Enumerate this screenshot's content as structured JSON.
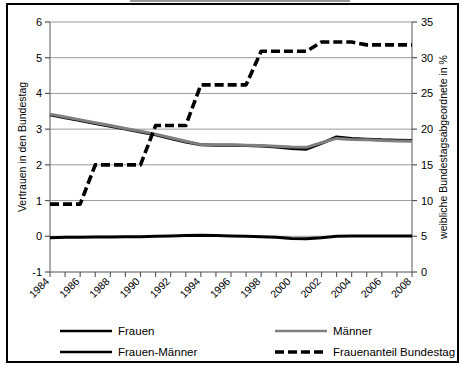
{
  "chart_data": {
    "type": "line",
    "title": "",
    "xlabel": "",
    "ylabel": "Vertrauen in den Bundestag",
    "y2label": "weibliche Bundestagsabgeordnete in %",
    "x": [
      1984,
      1985,
      1986,
      1987,
      1988,
      1989,
      1990,
      1991,
      1992,
      1993,
      1994,
      1995,
      1996,
      1997,
      1998,
      1999,
      2000,
      2001,
      2002,
      2003,
      2004,
      2005,
      2006,
      2007,
      2008
    ],
    "xtick_labels": [
      "1984",
      "1986",
      "1988",
      "1990",
      "1992",
      "1994",
      "1996",
      "1998",
      "2000",
      "2002",
      "2004",
      "2006",
      "2008"
    ],
    "ylim": [
      -1,
      6
    ],
    "yticks": [
      -1,
      0,
      1,
      2,
      3,
      4,
      5,
      6
    ],
    "y2lim": [
      0,
      35
    ],
    "y2ticks": [
      0,
      5,
      10,
      15,
      20,
      25,
      30,
      35
    ],
    "grid": true,
    "legend_position": "bottom",
    "series": [
      {
        "name": "Frauen",
        "axis": "left",
        "color": "#000000",
        "style": "solid",
        "values": [
          3.4,
          3.32,
          3.24,
          3.16,
          3.08,
          3.0,
          2.92,
          2.84,
          2.74,
          2.64,
          2.56,
          2.55,
          2.55,
          2.54,
          2.53,
          2.5,
          2.46,
          2.44,
          2.6,
          2.78,
          2.74,
          2.72,
          2.7,
          2.69,
          2.68
        ]
      },
      {
        "name": "Männer",
        "axis": "left",
        "color": "#7f7f7f",
        "style": "solid",
        "values": [
          3.42,
          3.34,
          3.26,
          3.18,
          3.1,
          3.02,
          2.94,
          2.86,
          2.76,
          2.66,
          2.57,
          2.56,
          2.56,
          2.55,
          2.54,
          2.52,
          2.5,
          2.49,
          2.62,
          2.74,
          2.71,
          2.7,
          2.68,
          2.67,
          2.66
        ]
      },
      {
        "name": "Frauen-Männer",
        "axis": "left",
        "color": "#000000",
        "style": "solid",
        "values": [
          -0.04,
          -0.03,
          -0.03,
          -0.02,
          -0.02,
          -0.01,
          -0.01,
          0.0,
          0.01,
          0.02,
          0.03,
          0.02,
          0.01,
          0.0,
          -0.01,
          -0.03,
          -0.06,
          -0.07,
          -0.04,
          0.0,
          0.01,
          0.01,
          0.01,
          0.01,
          0.01
        ]
      },
      {
        "name": "Frauenanteil Bundestag",
        "axis": "right",
        "color": "#000000",
        "style": "dashed",
        "values": [
          9.5,
          9.5,
          9.5,
          15.0,
          15.0,
          15.0,
          15.0,
          20.5,
          20.5,
          20.5,
          26.2,
          26.2,
          26.2,
          26.2,
          30.9,
          30.9,
          30.9,
          30.9,
          32.2,
          32.2,
          32.2,
          31.8,
          31.8,
          31.8,
          31.8
        ]
      }
    ]
  },
  "axes": {
    "left_title": "Vertrauen in den Bundestag",
    "right_title": "weibliche Bundestagsabgeordnete in %",
    "left_ticks": [
      "6",
      "5",
      "4",
      "3",
      "2",
      "1",
      "0",
      "-1"
    ],
    "right_ticks": [
      "35",
      "30",
      "25",
      "20",
      "15",
      "10",
      "5",
      "0"
    ],
    "x_ticks": [
      "1984",
      "1986",
      "1988",
      "1990",
      "1992",
      "1994",
      "1996",
      "1998",
      "2000",
      "2002",
      "2004",
      "2006",
      "2008"
    ]
  },
  "legend": {
    "items": [
      {
        "label": "Frauen",
        "color": "#000000",
        "style": "solid"
      },
      {
        "label": "Männer",
        "color": "#7f7f7f",
        "style": "solid"
      },
      {
        "label": "Frauen-Männer",
        "color": "#000000",
        "style": "solid"
      },
      {
        "label": "Frauenanteil Bundestag",
        "color": "#000000",
        "style": "dashed"
      }
    ]
  }
}
